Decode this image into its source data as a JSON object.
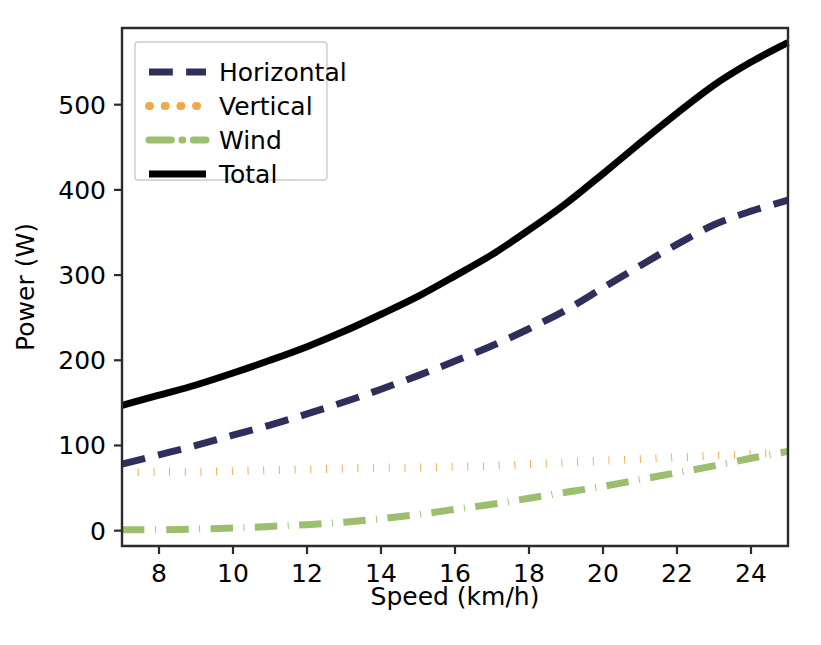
{
  "chart_data": {
    "type": "line",
    "title": "",
    "xlabel": "Speed (km/h)",
    "ylabel": "Power (W)",
    "xlim": [
      7,
      25
    ],
    "ylim": [
      -18,
      590
    ],
    "grid": false,
    "legend_position": "upper left",
    "xticks": [
      8,
      10,
      12,
      14,
      16,
      18,
      20,
      22,
      24
    ],
    "xtick_labels": [
      "8",
      "10",
      "12",
      "14",
      "16",
      "18",
      "20",
      "22",
      "24"
    ],
    "yticks": [
      0,
      100,
      200,
      300,
      400,
      500
    ],
    "ytick_labels": [
      "0",
      "100",
      "200",
      "300",
      "400",
      "500"
    ],
    "x": [
      7,
      8,
      9,
      10,
      11,
      12,
      13,
      14,
      15,
      16,
      17,
      18,
      19,
      20,
      21,
      22,
      23,
      24,
      25
    ],
    "series": [
      {
        "name": "Horizontal",
        "color": "#2e2f5b",
        "style": "dashed",
        "width": 7,
        "values": [
          78,
          89,
          100,
          112,
          124,
          137,
          151,
          166,
          182,
          199,
          217,
          237,
          259,
          285,
          311,
          336,
          359,
          375,
          388
        ]
      },
      {
        "name": "Vertical",
        "color": "#f0a848",
        "style": "dotted",
        "width": 8,
        "values": [
          68,
          69,
          69,
          70,
          71,
          72,
          73,
          74,
          74,
          75,
          76,
          78,
          80,
          82,
          84,
          86,
          88,
          90,
          92
        ]
      },
      {
        "name": "Wind",
        "color": "#9bbf6e",
        "style": "dashdot",
        "width": 7,
        "values": [
          1,
          1,
          2,
          3,
          5,
          7,
          10,
          14,
          19,
          25,
          31,
          38,
          45,
          52,
          60,
          68,
          76,
          85,
          93
        ]
      },
      {
        "name": "Total",
        "color": "#000000",
        "style": "solid",
        "width": 7,
        "values": [
          147,
          159,
          171,
          185,
          200,
          216,
          234,
          254,
          275,
          299,
          324,
          353,
          384,
          419,
          455,
          490,
          523,
          550,
          573
        ]
      }
    ]
  },
  "legend": {
    "items": [
      {
        "label": "Horizontal"
      },
      {
        "label": "Vertical"
      },
      {
        "label": "Wind"
      },
      {
        "label": "Total"
      }
    ]
  }
}
